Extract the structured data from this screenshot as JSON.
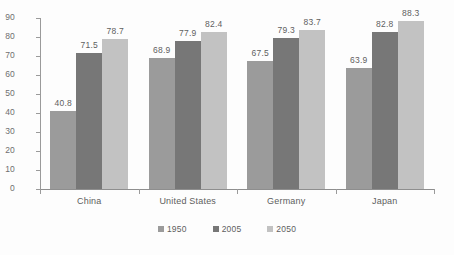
{
  "chart_data": {
    "type": "bar",
    "title": "",
    "subtitle": "",
    "xlabel": "",
    "ylabel": "",
    "ylim": [
      0,
      90
    ],
    "y_ticks": [
      0,
      10,
      20,
      30,
      40,
      50,
      60,
      70,
      80,
      90
    ],
    "grid": false,
    "legend_position": "bottom",
    "categories": [
      "China",
      "United States",
      "Germany",
      "Japan"
    ],
    "series": [
      {
        "name": "1950",
        "color": "#9b9b9b",
        "values": [
          40.8,
          68.9,
          67.5,
          63.9
        ]
      },
      {
        "name": "2005",
        "color": "#777777",
        "values": [
          71.5,
          77.9,
          79.3,
          82.8
        ]
      },
      {
        "name": "2050",
        "color": "#c2c2c2",
        "values": [
          78.7,
          82.4,
          83.7,
          88.3
        ]
      }
    ],
    "value_labels": [
      [
        "40.8",
        "71.5",
        "78.7"
      ],
      [
        "68.9",
        "77.9",
        "82.4"
      ],
      [
        "67.5",
        "79.3",
        "83.7"
      ],
      [
        "63.9",
        "82.8",
        "88.3"
      ]
    ],
    "tick_labels": [
      "90",
      "80",
      "70",
      "60",
      "50",
      "40",
      "30",
      "20",
      "10",
      "0"
    ]
  }
}
